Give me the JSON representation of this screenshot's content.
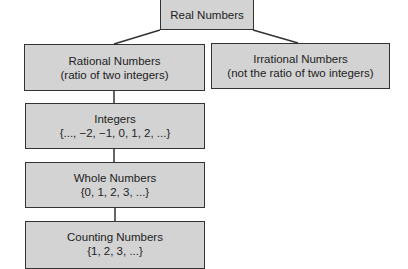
{
  "diagram": {
    "colors": {
      "box_fill": "#d3d3d3",
      "box_border": "#333333",
      "text": "#222222",
      "connector": "#333333",
      "background": "#ffffff"
    },
    "nodes": {
      "real": {
        "label": "Real Numbers"
      },
      "rational": {
        "label": "Rational Numbers",
        "description": "(ratio of two integers)"
      },
      "irrational": {
        "label": "Irrational Numbers",
        "description": "(not the ratio of two integers)"
      },
      "integers": {
        "label": "Integers",
        "description": "{..., −2, −1, 0, 1, 2, ...}"
      },
      "whole": {
        "label": "Whole Numbers",
        "description": "{0, 1, 2, 3, ...}"
      },
      "counting": {
        "label": "Counting Numbers",
        "description": "{1, 2, 3, ...}"
      }
    },
    "edges": [
      {
        "from": "real",
        "to": "rational"
      },
      {
        "from": "real",
        "to": "irrational"
      },
      {
        "from": "rational",
        "to": "integers"
      },
      {
        "from": "integers",
        "to": "whole"
      },
      {
        "from": "whole",
        "to": "counting"
      }
    ]
  }
}
